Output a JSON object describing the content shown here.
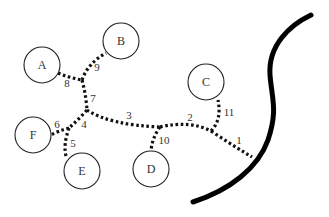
{
  "diagram": {
    "type": "tree-network",
    "nodes": [
      {
        "id": "A",
        "label": "A",
        "cx": 42,
        "cy": 65,
        "r": 18
      },
      {
        "id": "B",
        "label": "B",
        "cx": 121,
        "cy": 41,
        "r": 18
      },
      {
        "id": "C",
        "label": "C",
        "cx": 206,
        "cy": 82,
        "r": 18
      },
      {
        "id": "D",
        "label": "D",
        "cx": 151,
        "cy": 169,
        "r": 18
      },
      {
        "id": "E",
        "label": "E",
        "cx": 82,
        "cy": 171,
        "r": 18
      },
      {
        "id": "F",
        "label": "F",
        "cx": 33,
        "cy": 135,
        "r": 18
      }
    ],
    "edges": [
      {
        "id": "1",
        "label": "1",
        "path": "M211,131 Q232,145 252,157",
        "label_x": 239,
        "label_y": 140
      },
      {
        "id": "2",
        "label": "2",
        "path": "M160,127 Q190,120 211,131",
        "label_x": 190,
        "label_y": 117
      },
      {
        "id": "3",
        "label": "3",
        "path": "M87,110 Q110,125 160,127",
        "label_x": 129,
        "label_y": 115
      },
      {
        "id": "4",
        "label": "4",
        "path": "M87,110 Q78,120 69,128",
        "label_x": 84,
        "label_y": 124
      },
      {
        "id": "5",
        "label": "5",
        "path": "M69,128 Q63,145 66,156",
        "label_x": 73,
        "label_y": 143
      },
      {
        "id": "6",
        "label": "6",
        "path": "M69,128 Q58,131 51,135",
        "label_x": 57,
        "label_y": 124
      },
      {
        "id": "7",
        "label": "7",
        "path": "M82,80 Q86,95 87,110",
        "label_x": 93,
        "label_y": 98
      },
      {
        "id": "8",
        "label": "8",
        "path": "M58,73 Q70,78 82,80",
        "label_x": 67,
        "label_y": 83
      },
      {
        "id": "9",
        "label": "9",
        "path": "M82,80 Q88,63 106,53",
        "label_x": 97,
        "label_y": 67
      },
      {
        "id": "10",
        "label": "10",
        "path": "M160,127 Q152,138 151,151",
        "label_x": 164,
        "label_y": 140
      },
      {
        "id": "11",
        "label": "11",
        "path": "M211,131 Q222,120 218,100",
        "label_x": 229,
        "label_y": 112
      }
    ],
    "boundary": {
      "path": "M311,15 C290,25 268,45 270,75 C272,100 278,110 268,140 C258,168 230,190 193,202"
    }
  }
}
